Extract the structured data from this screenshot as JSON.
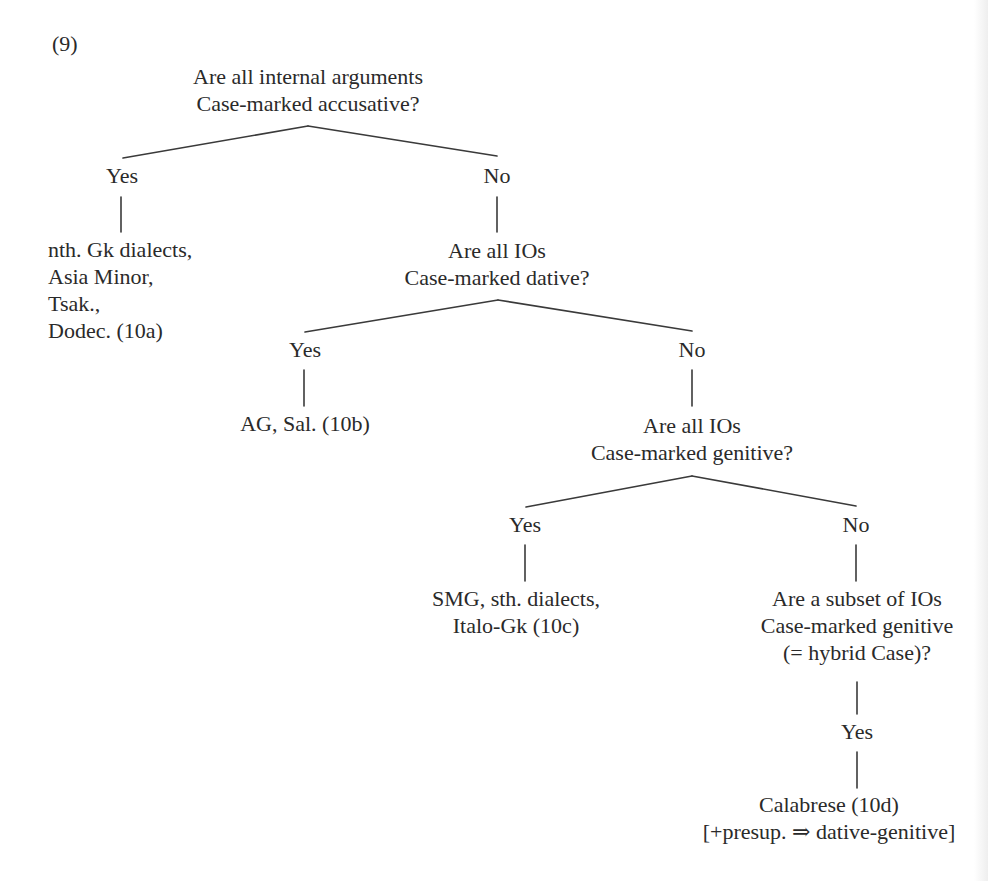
{
  "example_number": "(9)",
  "tree": {
    "q1": {
      "lines": [
        "Are all internal arguments",
        "Case-marked accusative?"
      ],
      "yes_label": "Yes",
      "no_label": "No",
      "yes_result": [
        "nth. Gk dialects,",
        "Asia Minor,",
        "Tsak.,",
        "Dodec. (10a)"
      ]
    },
    "q2": {
      "lines": [
        "Are all IOs",
        "Case-marked dative?"
      ],
      "yes_label": "Yes",
      "no_label": "No",
      "yes_result": [
        "AG, Sal. (10b)"
      ]
    },
    "q3": {
      "lines": [
        "Are all IOs",
        "Case-marked genitive?"
      ],
      "yes_label": "Yes",
      "no_label": "No",
      "yes_result": [
        "SMG, sth. dialects,",
        "Italo-Gk (10c)"
      ]
    },
    "q4": {
      "lines": [
        "Are a subset of IOs",
        "Case-marked genitive",
        "(= hybrid Case)?"
      ],
      "yes_label": "Yes",
      "yes_result": [
        "Calabrese (10d)",
        "[+presup. ⇒ dative-genitive]"
      ]
    }
  },
  "colors": {
    "text": "#2a2a2a",
    "lines": "#3a3a3a",
    "background": "#ffffff"
  }
}
